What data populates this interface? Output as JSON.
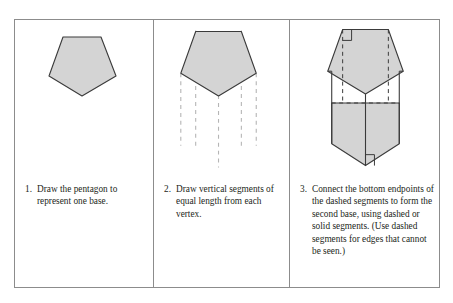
{
  "figure": {
    "panels": [
      {
        "number": "1.",
        "text": "Draw the pentagon to represent one base.",
        "art": "pentagon-base"
      },
      {
        "number": "2.",
        "text": "Draw vertical segments of equal length from each vertex.",
        "art": "pentagon-with-vertical-dashed-segments"
      },
      {
        "number": "3.",
        "text": "Connect the bottom endpoints of the dashed segments to form the second base, using dashed or solid segments. (Use dashed segments for edges that cannot be seen.)",
        "art": "pentagonal-prism"
      }
    ]
  },
  "style": {
    "shape_fill": "#d4d4d4",
    "shape_stroke": "#3a3a3a",
    "dashed_stroke": "#b5b5b5",
    "frame_stroke": "#8c8c8c",
    "text_color": "#231f20"
  }
}
